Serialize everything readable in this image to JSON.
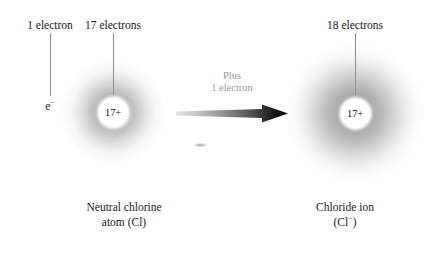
{
  "figure": {
    "background_color": "#fefefe"
  },
  "labels": {
    "one_electron": "1 electron",
    "seventeen_electrons": "17 electrons",
    "eighteen_electrons": "18 electrons",
    "electron_symbol": "e",
    "electron_symbol_charge": "−"
  },
  "atoms": {
    "left": {
      "nucleus_charge": "17+",
      "caption_line1": "Neutral chlorine",
      "caption_line2": "atom (Cl)",
      "electron_count": 17,
      "cloud_color": "#787878"
    },
    "right": {
      "nucleus_charge": "17+",
      "caption_line1": "Chloride ion",
      "caption_line2_prefix": "(Cl",
      "caption_line2_charge": "−",
      "caption_line2_suffix": ")",
      "electron_count": 18,
      "cloud_color": "#787878"
    }
  },
  "arrow": {
    "text_line1": "Plus",
    "text_line2": "1 electron",
    "text_color": "#9a9a9a",
    "start_color": "#e0e0e0",
    "end_color": "#000000",
    "direction": "right"
  }
}
